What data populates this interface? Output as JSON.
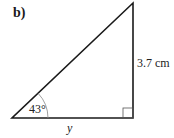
{
  "question_label": "b)",
  "triangle": {
    "vertices": {
      "bottom_left": [
        12,
        118
      ],
      "bottom_right": [
        133,
        118
      ],
      "top_right": [
        133,
        3
      ]
    },
    "right_angle": "bottom_right",
    "angle_label": "43°",
    "opposite_side_label": "3.7 cm",
    "adjacent_side_label": "y"
  }
}
